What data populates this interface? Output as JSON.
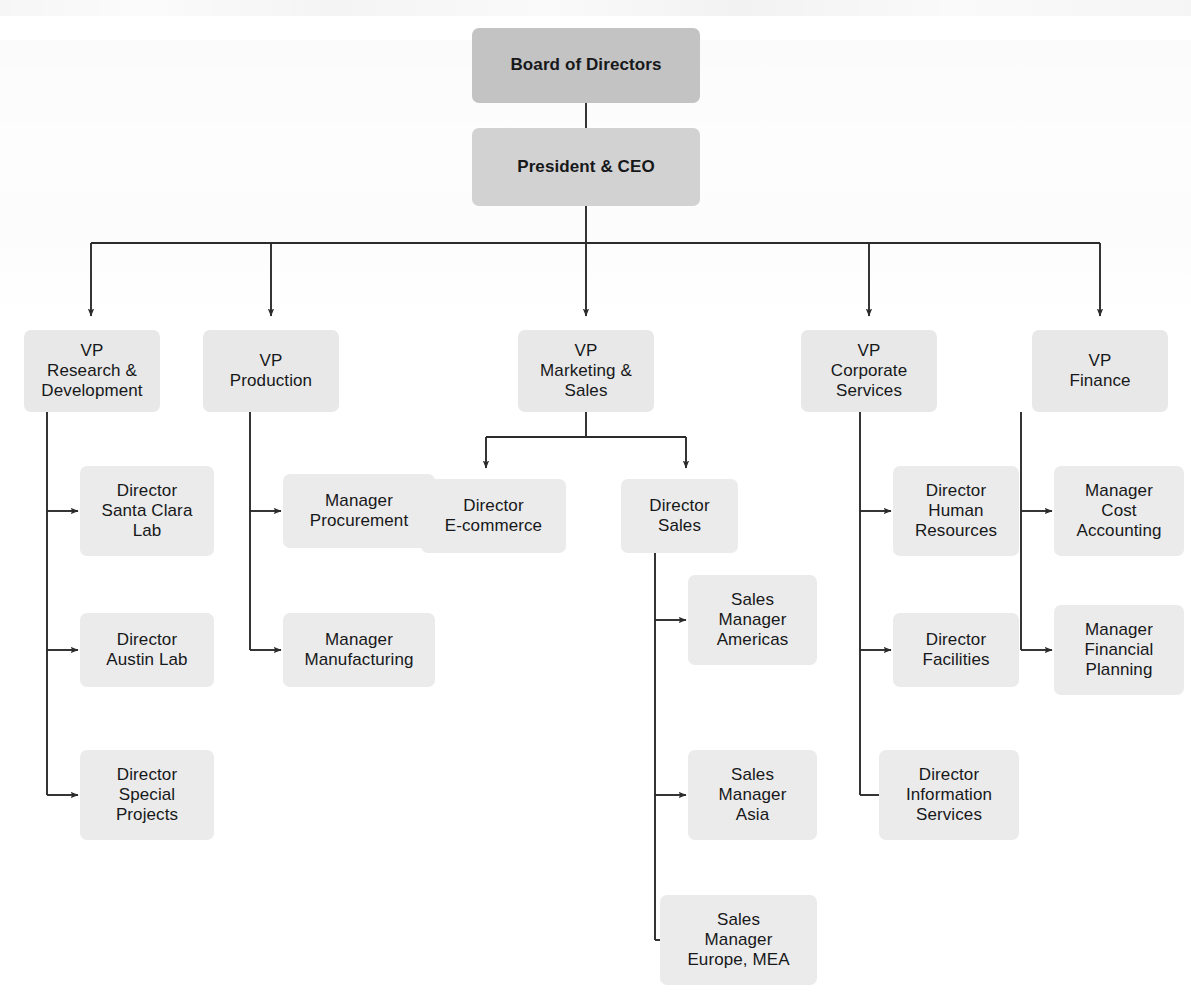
{
  "diagram": {
    "type": "org-chart",
    "title": "",
    "colors": {
      "board_fill": "#c3c3c3",
      "ceo_fill": "#d2d2d2",
      "vp_fill": "#e8e8e8",
      "subordinate_fill": "#ebebeb",
      "connector": "#2b2b2b",
      "text": "#17181a",
      "background": "#ffffff"
    },
    "nodes": [
      {
        "id": "board",
        "level": "board",
        "label": "Board of Directors"
      },
      {
        "id": "ceo",
        "level": "executive",
        "label": "President & CEO"
      },
      {
        "id": "vp-rd",
        "level": "vp",
        "label": "VP\nResearch &\nDevelopment"
      },
      {
        "id": "vp-prod",
        "level": "vp",
        "label": "VP\nProduction"
      },
      {
        "id": "vp-mktg",
        "level": "vp",
        "label": "VP\nMarketing &\nSales"
      },
      {
        "id": "vp-corp",
        "level": "vp",
        "label": "VP\nCorporate\nServices"
      },
      {
        "id": "vp-fin",
        "level": "vp",
        "label": "VP\nFinance"
      },
      {
        "id": "dir-santa-clara",
        "level": "director",
        "label": "Director\nSanta Clara\nLab"
      },
      {
        "id": "dir-austin",
        "level": "director",
        "label": "Director\nAustin Lab"
      },
      {
        "id": "dir-special",
        "level": "director",
        "label": "Director\nSpecial\nProjects"
      },
      {
        "id": "mgr-procurement",
        "level": "manager",
        "label": "Manager\nProcurement"
      },
      {
        "id": "mgr-manufacturing",
        "level": "manager",
        "label": "Manager\nManufacturing"
      },
      {
        "id": "dir-ecommerce",
        "level": "director",
        "label": "Director\nE-commerce"
      },
      {
        "id": "dir-sales",
        "level": "director",
        "label": "Director\nSales"
      },
      {
        "id": "sm-americas",
        "level": "manager",
        "label": "Sales\nManager\nAmericas"
      },
      {
        "id": "sm-asia",
        "level": "manager",
        "label": "Sales\nManager\nAsia"
      },
      {
        "id": "sm-europe",
        "level": "manager",
        "label": "Sales\nManager\nEurope, MEA"
      },
      {
        "id": "dir-hr",
        "level": "director",
        "label": "Director\nHuman\nResources"
      },
      {
        "id": "dir-facilities",
        "level": "director",
        "label": "Director\nFacilities"
      },
      {
        "id": "dir-info-svcs",
        "level": "director",
        "label": "Director\nInformation\nServices"
      },
      {
        "id": "mgr-cost-acct",
        "level": "manager",
        "label": "Manager\nCost\nAccounting"
      },
      {
        "id": "mgr-fin-plan",
        "level": "manager",
        "label": "Manager\nFinancial\nPlanning"
      }
    ],
    "edges": [
      {
        "from": "board",
        "to": "ceo"
      },
      {
        "from": "ceo",
        "to": "vp-rd"
      },
      {
        "from": "ceo",
        "to": "vp-prod"
      },
      {
        "from": "ceo",
        "to": "vp-mktg"
      },
      {
        "from": "ceo",
        "to": "vp-corp"
      },
      {
        "from": "ceo",
        "to": "vp-fin"
      },
      {
        "from": "vp-rd",
        "to": "dir-santa-clara"
      },
      {
        "from": "vp-rd",
        "to": "dir-austin"
      },
      {
        "from": "vp-rd",
        "to": "dir-special"
      },
      {
        "from": "vp-prod",
        "to": "mgr-procurement"
      },
      {
        "from": "vp-prod",
        "to": "mgr-manufacturing"
      },
      {
        "from": "vp-mktg",
        "to": "dir-ecommerce"
      },
      {
        "from": "vp-mktg",
        "to": "dir-sales"
      },
      {
        "from": "dir-sales",
        "to": "sm-americas"
      },
      {
        "from": "dir-sales",
        "to": "sm-asia"
      },
      {
        "from": "dir-sales",
        "to": "sm-europe"
      },
      {
        "from": "vp-corp",
        "to": "dir-hr"
      },
      {
        "from": "vp-corp",
        "to": "dir-facilities"
      },
      {
        "from": "vp-corp",
        "to": "dir-info-svcs"
      },
      {
        "from": "vp-fin",
        "to": "mgr-cost-acct"
      },
      {
        "from": "vp-fin",
        "to": "mgr-fin-plan"
      }
    ]
  }
}
